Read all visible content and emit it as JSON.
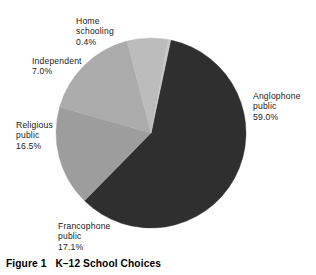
{
  "caption": {
    "label": "Figure 1",
    "title": "K–12 School Choices"
  },
  "chart_data": {
    "type": "pie",
    "title": "K–12 School Choices",
    "xlabel": "",
    "ylabel": "",
    "grid": false,
    "legend_position": "none",
    "labels_outside": true,
    "units": "percent",
    "total": 100.0,
    "center": {
      "cx": 151,
      "cy": 133,
      "r": 95
    },
    "start_angle_deg_from_top": 12.0,
    "direction": "clockwise",
    "categories": [
      "Anglophone public",
      "Francophone public",
      "Religious public",
      "Independent",
      "Home schooling"
    ],
    "values": [
      59.0,
      17.1,
      16.5,
      7.0,
      0.4
    ],
    "value_labels": [
      "59.0%",
      "17.1%",
      "16.5%",
      "7.0%",
      "0.4%"
    ],
    "colors": [
      "#2f2f2f",
      "#9d9d9d",
      "#ababab",
      "#bcbcbc",
      "#c8c8c8"
    ],
    "slices": [
      {
        "name": "Anglophone public",
        "value": 59.0,
        "value_label": "59.0%",
        "color": "#2f2f2f",
        "label_lines": [
          "Anglophone",
          "public",
          "59.0%"
        ]
      },
      {
        "name": "Francophone public",
        "value": 17.1,
        "value_label": "17.1%",
        "color": "#9d9d9d",
        "label_lines": [
          "Francophone",
          "public",
          "17.1%"
        ]
      },
      {
        "name": "Religious public",
        "value": 16.5,
        "value_label": "16.5%",
        "color": "#ababab",
        "label_lines": [
          "Religious",
          "public",
          "16.5%"
        ]
      },
      {
        "name": "Independent",
        "value": 7.0,
        "value_label": "7.0%",
        "color": "#bcbcbc",
        "label_lines": [
          "Independent",
          "7.0%"
        ]
      },
      {
        "name": "Home schooling",
        "value": 0.4,
        "value_label": "0.4%",
        "color": "#c8c8c8",
        "label_lines": [
          "Home",
          "schooling",
          "0.4%"
        ]
      }
    ]
  },
  "labels": {
    "home": {
      "l1": "Home",
      "l2": "schooling",
      "l3": "0.4%"
    },
    "independent": {
      "l1": "Independent",
      "l2": "7.0%"
    },
    "religious": {
      "l1": "Religious",
      "l2": "public",
      "l3": "16.5%"
    },
    "francophone": {
      "l1": "Francophone",
      "l2": "public",
      "l3": "17.1%"
    },
    "anglophone": {
      "l1": "Anglophone",
      "l2": "public",
      "l3": "59.0%"
    }
  }
}
